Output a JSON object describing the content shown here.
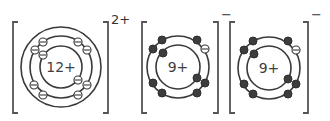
{
  "diagram": {
    "ions": [
      {
        "name": "magnesium-ion",
        "nucleus_label": "12+",
        "charge_label": "2+",
        "center": [
          61,
          67
        ],
        "rings": [
          21,
          31,
          40
        ],
        "electron_style": "hollow-minus",
        "electrons": [
          {
            "dx": -18,
            "dy": -25,
            "style": "hollow"
          },
          {
            "dx": 17,
            "dy": -25,
            "style": "hollow"
          },
          {
            "dx": -26,
            "dy": -17,
            "style": "hollow"
          },
          {
            "dx": 26,
            "dy": -17,
            "style": "hollow"
          },
          {
            "dx": -18,
            "dy": -12,
            "style": "hollow"
          },
          {
            "dx": 17,
            "dy": 13,
            "style": "hollow"
          },
          {
            "dx": -27,
            "dy": 18,
            "style": "hollow"
          },
          {
            "dx": 26,
            "dy": 18,
            "style": "hollow"
          },
          {
            "dx": -18,
            "dy": 28,
            "style": "hollow"
          },
          {
            "dx": 17,
            "dy": 28,
            "style": "hollow"
          }
        ],
        "bracket": {
          "left": 13,
          "right": 108,
          "top": 22,
          "bottom": 113
        }
      },
      {
        "name": "fluoride-ion-1",
        "nucleus_label": "9+",
        "charge_label": "−",
        "center": [
          178,
          67
        ],
        "rings": [
          22,
          31
        ],
        "electrons": [
          {
            "dx": -16,
            "dy": -27,
            "style": "filled"
          },
          {
            "dx": 19,
            "dy": -27,
            "style": "filled"
          },
          {
            "dx": -25,
            "dy": -18,
            "style": "filled"
          },
          {
            "dx": 27,
            "dy": -18,
            "style": "hollow"
          },
          {
            "dx": -15,
            "dy": -14,
            "style": "filled"
          },
          {
            "dx": 19,
            "dy": 11,
            "style": "filled"
          },
          {
            "dx": -25,
            "dy": 16,
            "style": "filled"
          },
          {
            "dx": 27,
            "dy": 16,
            "style": "filled"
          },
          {
            "dx": -16,
            "dy": 26,
            "style": "filled"
          },
          {
            "dx": 19,
            "dy": 26,
            "style": "filled"
          }
        ],
        "bracket": {
          "left": 142,
          "right": 218,
          "top": 22,
          "bottom": 113
        }
      },
      {
        "name": "fluoride-ion-2",
        "nucleus_label": "9+",
        "charge_label": "−",
        "center": [
          269,
          68
        ],
        "rings": [
          22,
          31
        ],
        "electrons": [
          {
            "dx": -16,
            "dy": -27,
            "style": "filled"
          },
          {
            "dx": 19,
            "dy": -27,
            "style": "filled"
          },
          {
            "dx": -25,
            "dy": -18,
            "style": "filled"
          },
          {
            "dx": 27,
            "dy": -18,
            "style": "hollow"
          },
          {
            "dx": -15,
            "dy": -14,
            "style": "filled"
          },
          {
            "dx": 19,
            "dy": 11,
            "style": "filled"
          },
          {
            "dx": -25,
            "dy": 16,
            "style": "filled"
          },
          {
            "dx": 27,
            "dy": 16,
            "style": "filled"
          },
          {
            "dx": -16,
            "dy": 26,
            "style": "filled"
          },
          {
            "dx": 19,
            "dy": 26,
            "style": "filled"
          }
        ],
        "bracket": {
          "left": 230,
          "right": 308,
          "top": 22,
          "bottom": 113
        }
      }
    ],
    "colors": {
      "ring": "#3a3a3a",
      "electron_filled": "#3d3d3d",
      "bracket": "#555555",
      "text": "#3f3f3f"
    }
  }
}
